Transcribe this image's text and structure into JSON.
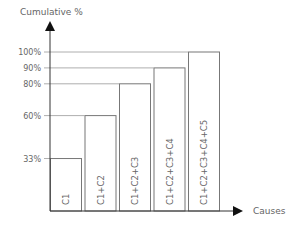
{
  "chart_data": {
    "type": "bar",
    "title": "",
    "xlabel": "Causes",
    "ylabel": "Cumulative %",
    "categories": [
      "C1",
      "C1+C2",
      "C1+C2+C3",
      "C1+C2+C3+C4",
      "C1+C2+C3+C4+C5"
    ],
    "values": [
      33,
      60,
      80,
      90,
      100
    ],
    "yticks": [
      "33%",
      "60%",
      "80%",
      "90%",
      "100%"
    ],
    "ylim": [
      0,
      100
    ],
    "grid": "horizontal lines at tick values",
    "legend": null
  },
  "colors": {
    "bar_stroke": "#777777",
    "bar_fill": "#ffffff",
    "axis": "#333333",
    "grid": "#999999"
  }
}
